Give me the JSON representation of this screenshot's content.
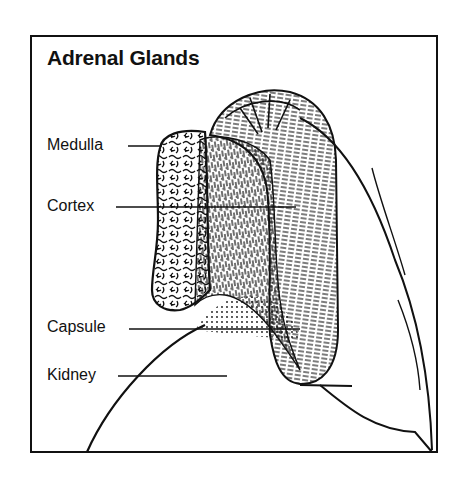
{
  "title": "Adrenal Glands",
  "labels": [
    {
      "id": "medulla",
      "text": "Medulla"
    },
    {
      "id": "cortex",
      "text": "Cortex"
    },
    {
      "id": "capsule",
      "text": "Capsule"
    },
    {
      "id": "kidney",
      "text": "Kidney"
    }
  ],
  "colors": {
    "ink": "#111111",
    "background": "#ffffff"
  }
}
